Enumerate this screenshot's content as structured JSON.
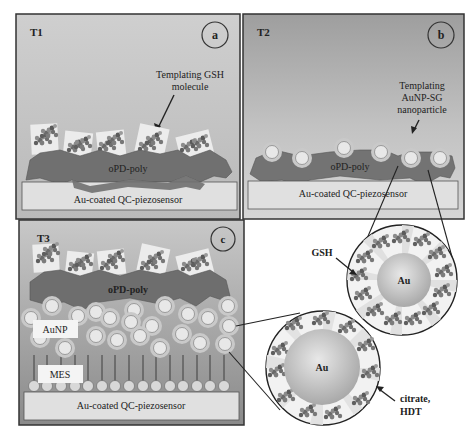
{
  "figure": {
    "panels": [
      {
        "id": "a",
        "stage": "T1",
        "badge": "a",
        "annotation_line1": "Templating GSH",
        "annotation_line2": "molecule",
        "polymer_label": "oPD-poly",
        "substrate_label": "Au-coated QC-piezosensor"
      },
      {
        "id": "b",
        "stage": "T2",
        "badge": "b",
        "annotation_line1": "Templating",
        "annotation_line2": "AuNP-SG",
        "annotation_line3": "nanoparticle",
        "polymer_label": "oPD-poly",
        "substrate_label": "Au-coated QC-piezosensor"
      },
      {
        "id": "c",
        "stage": "T3",
        "badge": "c",
        "polymer_label": "oPD-poly",
        "nanoparticle_label": "AuNP",
        "monolayer_label": "MES",
        "substrate_label": "Au-coated QC-piezosensor"
      }
    ],
    "insets": [
      {
        "id": "gsh-nanoparticle",
        "core_label": "Au",
        "ligand_label": "GSH"
      },
      {
        "id": "citrate-nanoparticle",
        "core_label": "Au",
        "ligand_label_line1": "citrate,",
        "ligand_label_line2": "HDT"
      }
    ],
    "colors": {
      "panel_bg": "#c4c4c4",
      "panel_bg_bottom": "#a8a8a8",
      "polymer": "#6e6e6e",
      "substrate": "#e2e2e2",
      "nanoparticle_shell": "#bdbdbd",
      "nanoparticle_core": "#e6e6e6",
      "au_core": "#b8b8b8",
      "frame": "#3a3a3a"
    }
  }
}
